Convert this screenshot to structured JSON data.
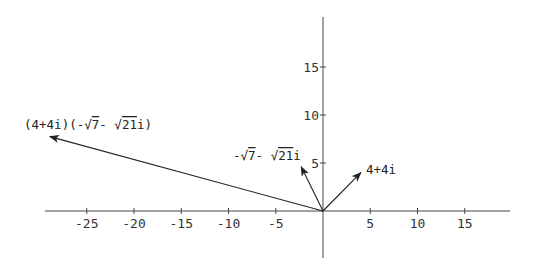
{
  "diagram": {
    "type": "complex-plane-vectors",
    "origin_px": [
      323,
      211
    ],
    "scale_px_per_unit": {
      "x": 9.45,
      "y": 9.6
    },
    "axes": {
      "x": {
        "range": [
          -29.5,
          19.5
        ],
        "ticks": [
          -25,
          -20,
          -15,
          -10,
          -5,
          5,
          10,
          15
        ],
        "tick_labels": [
          "-25",
          "-20",
          "-15",
          "-10",
          "-5",
          "5",
          "10",
          "15"
        ]
      },
      "y": {
        "range": [
          -5.5,
          20
        ],
        "ticks": [
          5,
          10,
          15
        ],
        "tick_labels": [
          "5",
          "10",
          "15"
        ]
      }
    },
    "vectors": [
      {
        "name": "z1",
        "label": "4+4i",
        "tip": [
          4,
          4
        ]
      },
      {
        "name": "z2",
        "label_prefix": "-",
        "label_sqrt_a": "7",
        "label_mid": "- ",
        "label_sqrt_b": "21",
        "label_suffix": "i",
        "tip": [
          -2.3,
          4.6
        ]
      },
      {
        "name": "product",
        "label_start": "(4+4i)(-",
        "label_sqrt_a": "7",
        "label_mid": "- ",
        "label_sqrt_b": "21",
        "label_end": "i)",
        "tip": [
          -28.9,
          7.75
        ]
      }
    ],
    "colors": {
      "axis": "#444444",
      "vector": "#222222",
      "text": "#333333",
      "background": "#ffffff"
    }
  }
}
